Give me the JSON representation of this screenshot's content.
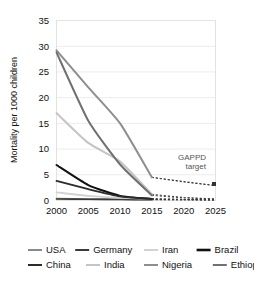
{
  "chart_data": {
    "type": "line",
    "title": "",
    "xlabel": "",
    "ylabel": "Mortality per 1000 children",
    "xlim": [
      2000,
      2025
    ],
    "ylim": [
      0,
      35
    ],
    "ytick_labels": [
      "0",
      "5",
      "10",
      "15",
      "20",
      "25",
      "30",
      "35"
    ],
    "yticks": [
      0,
      5,
      10,
      15,
      20,
      25,
      30,
      35
    ],
    "xtick_labels": [
      "2000",
      "2005",
      "2010",
      "2015",
      "2020",
      "2025"
    ],
    "xticks": [
      2000,
      2005,
      2010,
      2015,
      2020,
      2025
    ],
    "grid": "horizontal",
    "legend_position": "bottom",
    "x": [
      2000,
      2005,
      2010,
      2015
    ],
    "series": [
      {
        "name": "USA",
        "color": "#8a8a8a",
        "values": [
          0.4,
          0.3,
          0.25,
          0.2
        ],
        "projection": [
          0.2,
          0.15,
          0.1
        ]
      },
      {
        "name": "Germany",
        "color": "#3a3a3a",
        "values": [
          0.3,
          0.25,
          0.2,
          0.15
        ],
        "projection": [
          0.15,
          0.12,
          0.1
        ]
      },
      {
        "name": "Iran",
        "color": "#d2d2d2",
        "values": [
          1.6,
          0.9,
          0.5,
          0.3
        ],
        "projection": [
          0.3,
          0.2,
          0.15
        ]
      },
      {
        "name": "Brazil",
        "color": "#111111",
        "values": [
          6.9,
          3.0,
          0.9,
          0.3
        ],
        "projection": [
          0.3,
          0.2,
          0.15
        ]
      },
      {
        "name": "China",
        "color": "#2b2b2b",
        "values": [
          3.8,
          2.2,
          0.8,
          0.3
        ],
        "projection": [
          0.3,
          0.2,
          0.15
        ]
      },
      {
        "name": "India",
        "color": "#c4c4c4",
        "values": [
          17.0,
          11.2,
          7.6,
          1.2
        ],
        "projection": [
          1.2,
          0.6,
          0.3
        ]
      },
      {
        "name": "Nigeria",
        "color": "#8e8e8e",
        "values": [
          29.2,
          22.0,
          15.0,
          4.5
        ],
        "projection": [
          4.5,
          3.6,
          2.9
        ]
      },
      {
        "name": "Ethiopia",
        "color": "#707070",
        "values": [
          28.8,
          15.5,
          7.0,
          1.0
        ],
        "projection": [
          1.0,
          0.5,
          0.3
        ]
      }
    ],
    "projection_x": [
      2015,
      2020,
      2025
    ],
    "projection_style": "dashed",
    "annotations": [
      {
        "text_line1": "GAPPD",
        "text_line2": "target",
        "x": 2025,
        "y": 2.9,
        "marker": "square"
      }
    ]
  },
  "legend": {
    "rows": [
      [
        {
          "label": "USA",
          "color": "#8a8a8a"
        },
        {
          "label": "Germany",
          "color": "#3a3a3a"
        },
        {
          "label": "Iran",
          "color": "#d2d2d2"
        },
        {
          "label": "Brazil",
          "color": "#111111"
        }
      ],
      [
        {
          "label": "China",
          "color": "#2b2b2b"
        },
        {
          "label": "India",
          "color": "#c4c4c4"
        },
        {
          "label": "Nigeria",
          "color": "#8e8e8e"
        },
        {
          "label": "Ethiopia",
          "color": "#707070"
        }
      ]
    ]
  }
}
